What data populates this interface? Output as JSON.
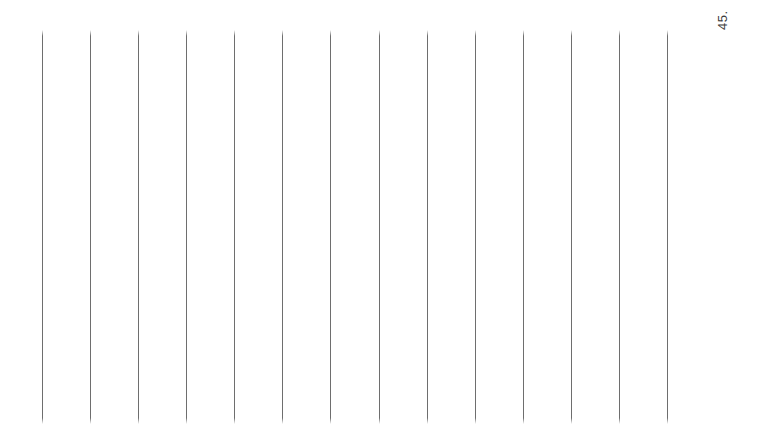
{
  "page": {
    "kind": "scanned-lined-page",
    "background_color": "#ffffff",
    "width": 762,
    "height": 437,
    "orientation_note": "landscape scan of a portrait ruled page rotated 90 degrees"
  },
  "folio": {
    "label": "45.",
    "color": "#3a3a3a",
    "font_size_px": 13,
    "rotation_deg": -90,
    "x": 716,
    "y": 30
  },
  "rules": {
    "color": "#6e6e6e",
    "thickness_px": 1,
    "count": 14,
    "top_px": 30,
    "bottom_px": 424,
    "length_px": 394,
    "spacing_px": 48.1,
    "x_positions": [
      42,
      90,
      138,
      186,
      234,
      282,
      330,
      379,
      427,
      475,
      523,
      571,
      619,
      667
    ]
  }
}
